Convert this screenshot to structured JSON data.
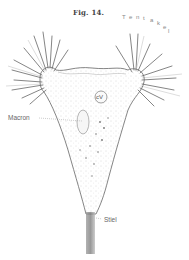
{
  "figure": {
    "title": "Fig. 14."
  },
  "labels": {
    "tentakel": "Tentakel",
    "tentakel_letters": [
      "T",
      "e",
      "n",
      "t",
      "a",
      "k",
      "e",
      "l"
    ],
    "cv": "cV",
    "macron": "Macron",
    "stiel": "Stiel"
  },
  "colors": {
    "ink": "#555555",
    "light_ink": "#999999",
    "background": "#ffffff"
  }
}
